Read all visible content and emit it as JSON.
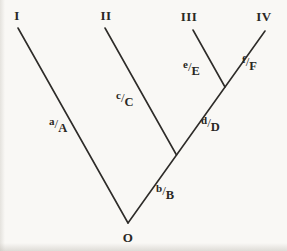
{
  "figure": {
    "kind": "cladogram",
    "root": {
      "label": "O"
    },
    "tips": [
      {
        "label": "I"
      },
      {
        "label": "II"
      },
      {
        "label": "III"
      },
      {
        "label": "IV"
      }
    ],
    "branch_labels": [
      {
        "char": "a",
        "sep": "/",
        "state": "A"
      },
      {
        "char": "b",
        "sep": "/",
        "state": "B"
      },
      {
        "char": "c",
        "sep": "/",
        "state": "C"
      },
      {
        "char": "d",
        "sep": "/",
        "state": "D"
      },
      {
        "char": "e",
        "sep": "/",
        "state": "E"
      },
      {
        "char": "f",
        "sep": "/",
        "state": "F"
      }
    ],
    "topology": [
      {
        "from": "O",
        "to": "I",
        "label": "a/A"
      },
      {
        "from": "O",
        "to": "node1",
        "label": "b/B"
      },
      {
        "from": "node1",
        "to": "II",
        "label": "c/C"
      },
      {
        "from": "node1",
        "to": "node2",
        "label": "d/D"
      },
      {
        "from": "node2",
        "to": "III",
        "label": "e/E"
      },
      {
        "from": "node2",
        "to": "IV",
        "label": "f/F"
      }
    ],
    "colors": {
      "line": "#2e2c29",
      "text": "#2a2824",
      "background": "#f9f8f5"
    }
  }
}
